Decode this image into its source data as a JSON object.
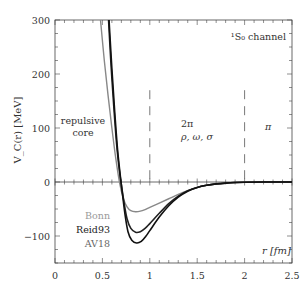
{
  "chart_data": {
    "type": "line",
    "title": "",
    "channel_label": "¹S₀ channel",
    "xlabel": "r [fm]",
    "ylabel": "V_C(r) [MeV]",
    "xlim": [
      0,
      2.5
    ],
    "ylim": [
      -150,
      300
    ],
    "xticks": [
      0,
      0.5,
      1,
      1.5,
      2,
      2.5
    ],
    "xtick_labels": [
      "0",
      "0.5",
      "1",
      "1.5",
      "2",
      "2.5"
    ],
    "yticks": [
      -100,
      0,
      100,
      200,
      300
    ],
    "ytick_labels": [
      "−100",
      "0",
      "100",
      "200",
      "300"
    ],
    "grid": false,
    "zero_line": true,
    "region_dividers": [
      1.0,
      2.0
    ],
    "annotations": [
      {
        "text": "repulsive",
        "x": 0.3,
        "y": 100
      },
      {
        "text": "core",
        "x": 0.3,
        "y": 80
      },
      {
        "text": "2π",
        "x": 1.45,
        "y": 100
      },
      {
        "text": "ρ, ω, σ",
        "x": 1.5,
        "y": 82
      },
      {
        "text": "π",
        "x": 2.3,
        "y": 90
      }
    ],
    "legend": {
      "position": "lower-left",
      "entries": [
        "Bonn",
        "Reid93",
        "AV18"
      ]
    },
    "series": [
      {
        "name": "Bonn",
        "color": "#888888",
        "x": [
          0.48,
          0.52,
          0.56,
          0.6,
          0.64,
          0.68,
          0.72,
          0.76,
          0.8,
          0.85,
          0.9,
          0.95,
          1.0,
          1.1,
          1.2,
          1.3,
          1.4,
          1.5,
          1.6,
          1.7,
          1.8,
          1.9,
          2.0,
          2.2,
          2.5
        ],
        "y": [
          300,
          225,
          160,
          100,
          45,
          0,
          -30,
          -46,
          -53,
          -55,
          -54,
          -51,
          -47,
          -39,
          -31,
          -23,
          -16,
          -10,
          -6,
          -3.5,
          -2,
          -1,
          -0.5,
          -0.1,
          0
        ]
      },
      {
        "name": "Reid93",
        "color": "#222222",
        "x": [
          0.565,
          0.59,
          0.62,
          0.65,
          0.68,
          0.7,
          0.73,
          0.76,
          0.8,
          0.85,
          0.9,
          0.95,
          1.0,
          1.1,
          1.2,
          1.3,
          1.4,
          1.5,
          1.6,
          1.7,
          1.8,
          1.9,
          2.0,
          2.2,
          2.5
        ],
        "y": [
          300,
          220,
          140,
          70,
          20,
          -5,
          -40,
          -68,
          -86,
          -93,
          -92,
          -86,
          -77,
          -58,
          -40,
          -26,
          -16,
          -10,
          -6,
          -3.5,
          -2,
          -1,
          -0.5,
          -0.1,
          0
        ]
      },
      {
        "name": "AV18",
        "color": "#111111",
        "x": [
          0.57,
          0.6,
          0.63,
          0.66,
          0.69,
          0.71,
          0.74,
          0.77,
          0.81,
          0.86,
          0.91,
          0.96,
          1.0,
          1.1,
          1.2,
          1.3,
          1.4,
          1.5,
          1.6,
          1.7,
          1.8,
          1.9,
          2.0,
          2.2,
          2.5
        ],
        "y": [
          300,
          210,
          130,
          60,
          10,
          -20,
          -62,
          -92,
          -108,
          -113,
          -110,
          -100,
          -90,
          -65,
          -44,
          -28,
          -17,
          -10,
          -6,
          -3.5,
          -2,
          -1,
          -0.5,
          -0.1,
          0
        ]
      }
    ]
  }
}
